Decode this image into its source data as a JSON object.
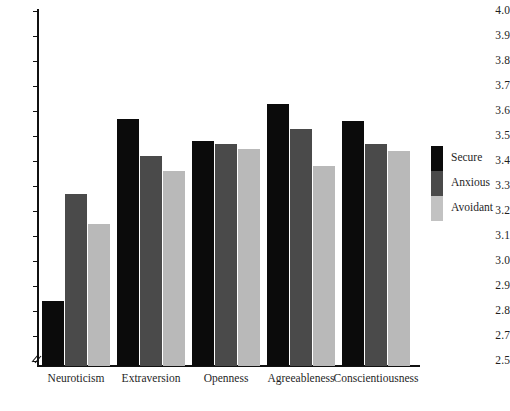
{
  "chart_data": {
    "type": "bar",
    "title": "",
    "xlabel": "",
    "ylabel": "",
    "ylim": [
      2.5,
      4.0
    ],
    "grid": false,
    "axis_break": true,
    "axis_break_between": [
      2.5,
      2.7
    ],
    "legend_position": "right",
    "categories": [
      "Neuroticism",
      "Extraversion",
      "Openness",
      "Agreeableness",
      "Conscientiousness"
    ],
    "yticks": [
      "4.0",
      "3.9",
      "3.8",
      "3.7",
      "3.6",
      "3.5",
      "3.4",
      "3.3",
      "3.2",
      "3.1",
      "3.0",
      "2.9",
      "2.8",
      "2.7",
      "2.5"
    ],
    "ytick_values": [
      4.0,
      3.9,
      3.8,
      3.7,
      3.6,
      3.5,
      3.4,
      3.3,
      3.2,
      3.1,
      3.0,
      2.9,
      2.8,
      2.7,
      2.5
    ],
    "series": [
      {
        "name": "Secure",
        "color": "#0b0b0b",
        "values": [
          2.84,
          3.57,
          3.48,
          3.63,
          3.56
        ]
      },
      {
        "name": "Anxious",
        "color": "#4a4a4a",
        "values": [
          3.27,
          3.42,
          3.47,
          3.53,
          3.47
        ]
      },
      {
        "name": "Avoidant",
        "color": "#b9b9b9",
        "values": [
          3.15,
          3.36,
          3.45,
          3.38,
          3.44
        ]
      }
    ]
  },
  "legend": {
    "items": [
      {
        "label": "Secure",
        "color": "#0b0b0b"
      },
      {
        "label": "Anxious",
        "color": "#4a4a4a"
      },
      {
        "label": "Avoidant",
        "color": "#c2c2c2"
      }
    ]
  },
  "axis": {
    "break_symbol": "axis-break-zigzag"
  }
}
